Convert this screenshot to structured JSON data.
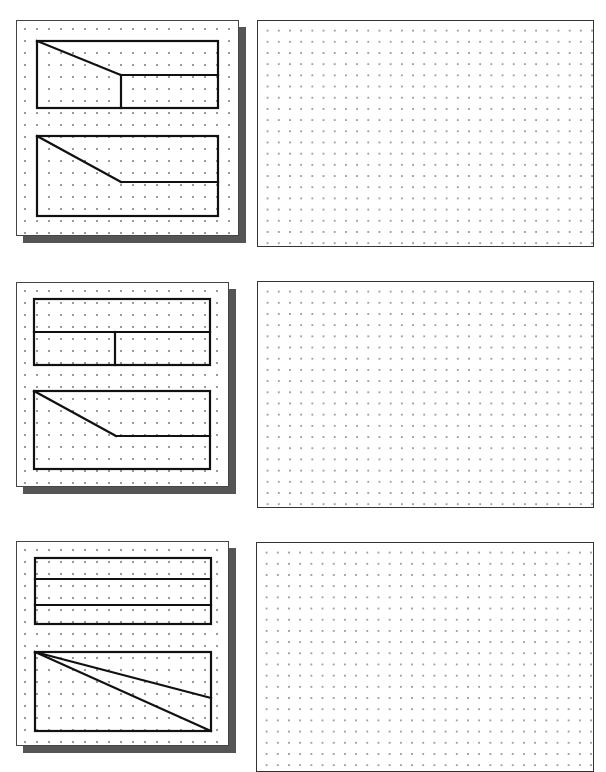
{
  "page": {
    "title_fragment": "",
    "colors": {
      "line": "#111111",
      "shadow": "#555555",
      "dot": "#9a9a9a",
      "border": "#444444"
    }
  },
  "exercises": [
    {
      "id": 1,
      "views": [
        {
          "type": "rect-with-slope-and-split",
          "description": "Top view: rectangle with diagonal from top-left to mid, horizontal line at middle to right edge, vertical line down from midpoint"
        },
        {
          "type": "rect-with-slope",
          "description": "Front view: rectangle with diagonal from top-left to mid, horizontal line to right edge"
        }
      ],
      "sketch_area": "blank dot grid"
    },
    {
      "id": 2,
      "views": [
        {
          "type": "rect-split-horizontal-and-vertical",
          "description": "Top view: rectangle split horizontally at middle, lower half split vertically"
        },
        {
          "type": "rect-with-slope",
          "description": "Front view: rectangle with diagonal from top-left to mid, horizontal line to right edge"
        }
      ],
      "sketch_area": "blank dot grid"
    },
    {
      "id": 3,
      "views": [
        {
          "type": "rect-three-bands",
          "description": "Top view: rectangle divided into three horizontal bands"
        },
        {
          "type": "rect-two-diagonals",
          "description": "Front view: rectangle with two lines from top-left corner to right edge (mid-lower and bottom-right)"
        }
      ],
      "sketch_area": "blank dot grid"
    }
  ]
}
